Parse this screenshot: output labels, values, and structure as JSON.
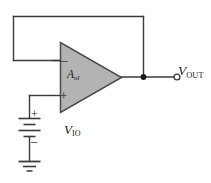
{
  "diagram": {
    "background_color": "#ffffff",
    "line_color": "#3a3a3a",
    "amp_fill_color": "#b3b3b3",
    "amp_border_color": "#4a4a4a",
    "text_color": "#1a1a1a"
  },
  "opamp": {
    "name": "operational-amplifier",
    "gain_label": {
      "symbol": "A",
      "subscript": "ol",
      "full": "Aol"
    },
    "inverting_input": {
      "sign": "–",
      "name": "inverting-input"
    },
    "noninverting_input": {
      "sign": "+",
      "name": "non-inverting-input"
    }
  },
  "output": {
    "label": {
      "symbol": "V",
      "subscript": "OUT",
      "full": "VOUT"
    },
    "terminal_type": "open-circle"
  },
  "source": {
    "label": {
      "symbol": "V",
      "subscript": "IO",
      "full": "VIO"
    },
    "type": "dc-battery",
    "plus_sign": "+",
    "minus_sign": "–",
    "cells": 2
  },
  "ground": {
    "name": "ground-symbol",
    "type": "earth-ground"
  },
  "feedback": {
    "name": "feedback-loop",
    "description": "output tied back to inverting input"
  },
  "nodes": {
    "output_junction": "junction-dot"
  }
}
